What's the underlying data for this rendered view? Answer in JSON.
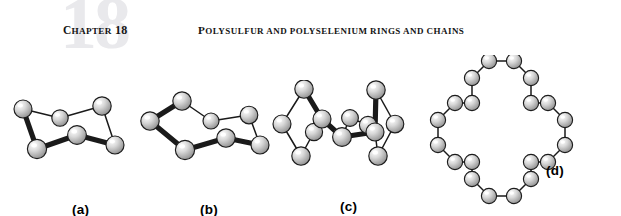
{
  "header": {
    "chapter_watermark": "18",
    "chapter_label_lead": "C",
    "chapter_label_rest": "HAPTER",
    "chapter_number": "18",
    "running_head_lead": "P",
    "running_head_rest": "OLYSULFUR AND POLYSELENIUM RINGS AND CHAINS",
    "watermark_color": "#e9e9ec",
    "text_color": "#141414"
  },
  "figure": {
    "caption_font_color": "#000000",
    "atom_fill_light": "#ffffff",
    "atom_fill_mid": "#d8d8d8",
    "atom_fill_dark": "#8e8e8e",
    "atom_stroke": "#1c1c1c",
    "bond_color": "#1a1a1a",
    "panels": [
      {
        "id": "panel-a",
        "label": "(a)",
        "molecule": "S6 hexasulfur chair ring",
        "atom_count": 6,
        "label_x": 60,
        "label_y": 119,
        "atoms": [
          {
            "x": 11,
            "y": 26,
            "r": 9.0
          },
          {
            "x": 48,
            "y": 35,
            "r": 8.2
          },
          {
            "x": 90,
            "y": 23,
            "r": 9.2
          },
          {
            "x": 103,
            "y": 62,
            "r": 9.0
          },
          {
            "x": 65,
            "y": 52,
            "r": 9.4
          },
          {
            "x": 25,
            "y": 66,
            "r": 9.6
          }
        ],
        "bonds": [
          {
            "from": 0,
            "to": 1,
            "weight": "thin"
          },
          {
            "from": 1,
            "to": 2,
            "weight": "thin"
          },
          {
            "from": 2,
            "to": 3,
            "weight": "thin"
          },
          {
            "from": 3,
            "to": 4,
            "weight": "thick"
          },
          {
            "from": 4,
            "to": 5,
            "weight": "thick"
          },
          {
            "from": 5,
            "to": 0,
            "weight": "thick"
          }
        ]
      },
      {
        "id": "panel-b",
        "label": "(b)",
        "molecule": "S7 heptasulfur ring",
        "atom_count": 7,
        "label_x": 62,
        "label_y": 119,
        "atoms": [
          {
            "x": 12,
            "y": 38,
            "r": 9.2
          },
          {
            "x": 44,
            "y": 18,
            "r": 9.2
          },
          {
            "x": 73,
            "y": 38,
            "r": 8.0
          },
          {
            "x": 111,
            "y": 32,
            "r": 8.8
          },
          {
            "x": 122,
            "y": 62,
            "r": 9.0
          },
          {
            "x": 88,
            "y": 55,
            "r": 9.2
          },
          {
            "x": 47,
            "y": 67,
            "r": 9.6
          }
        ],
        "bonds": [
          {
            "from": 0,
            "to": 1,
            "weight": "thick"
          },
          {
            "from": 1,
            "to": 2,
            "weight": "thin"
          },
          {
            "from": 2,
            "to": 3,
            "weight": "thin"
          },
          {
            "from": 3,
            "to": 4,
            "weight": "thin"
          },
          {
            "from": 4,
            "to": 5,
            "weight": "thick"
          },
          {
            "from": 5,
            "to": 6,
            "weight": "thick"
          },
          {
            "from": 6,
            "to": 0,
            "weight": "thick"
          }
        ]
      },
      {
        "id": "panel-c",
        "label": "(c)",
        "molecule": "S12 dodecasulfur ring, edge-on view",
        "atom_count": 12,
        "label_x": 68,
        "label_y": 119,
        "atoms": [
          {
            "x": 32,
            "y": 9,
            "r": 9.2
          },
          {
            "x": 10,
            "y": 44,
            "r": 9.0
          },
          {
            "x": 29,
            "y": 76,
            "r": 9.2
          },
          {
            "x": 42,
            "y": 52,
            "r": 8.6
          },
          {
            "x": 50,
            "y": 39,
            "r": 9.0
          },
          {
            "x": 70,
            "y": 57,
            "r": 9.4
          },
          {
            "x": 78,
            "y": 38,
            "r": 8.4
          },
          {
            "x": 96,
            "y": 45,
            "r": 8.6
          },
          {
            "x": 103,
            "y": 52,
            "r": 9.0
          },
          {
            "x": 104,
            "y": 10,
            "r": 9.2
          },
          {
            "x": 123,
            "y": 44,
            "r": 8.8
          },
          {
            "x": 106,
            "y": 76,
            "r": 9.2
          }
        ],
        "bonds": [
          {
            "from": 0,
            "to": 1,
            "weight": "thin"
          },
          {
            "from": 1,
            "to": 2,
            "weight": "thin"
          },
          {
            "from": 2,
            "to": 3,
            "weight": "thin"
          },
          {
            "from": 0,
            "to": 4,
            "weight": "thick"
          },
          {
            "from": 4,
            "to": 5,
            "weight": "thick"
          },
          {
            "from": 5,
            "to": 6,
            "weight": "thin"
          },
          {
            "from": 6,
            "to": 7,
            "weight": "thin"
          },
          {
            "from": 5,
            "to": 8,
            "weight": "thick"
          },
          {
            "from": 8,
            "to": 9,
            "weight": "thick"
          },
          {
            "from": 9,
            "to": 10,
            "weight": "thin"
          },
          {
            "from": 10,
            "to": 11,
            "weight": "thin"
          },
          {
            "from": 11,
            "to": 8,
            "weight": "thin"
          }
        ]
      },
      {
        "id": "panel-d",
        "label": "(d)",
        "molecule": "Large polysulfur cloverleaf macro-ring",
        "atom_count": 24,
        "label_x": 132,
        "label_y": 108,
        "atoms": [
          {
            "x": 75,
            "y": 6,
            "r": 7.6
          },
          {
            "x": 100,
            "y": 6,
            "r": 7.6
          },
          {
            "x": 117,
            "y": 23,
            "r": 7.6
          },
          {
            "x": 117,
            "y": 48,
            "r": 7.6
          },
          {
            "x": 134,
            "y": 48,
            "r": 7.6
          },
          {
            "x": 151,
            "y": 65,
            "r": 7.6
          },
          {
            "x": 151,
            "y": 90,
            "r": 7.6
          },
          {
            "x": 134,
            "y": 107,
            "r": 7.6
          },
          {
            "x": 117,
            "y": 107,
            "r": 7.6
          },
          {
            "x": 117,
            "y": 124,
            "r": 7.6
          },
          {
            "x": 100,
            "y": 141,
            "r": 7.6
          },
          {
            "x": 75,
            "y": 141,
            "r": 7.6
          },
          {
            "x": 58,
            "y": 124,
            "r": 7.6
          },
          {
            "x": 58,
            "y": 107,
            "r": 7.6
          },
          {
            "x": 41,
            "y": 107,
            "r": 7.6
          },
          {
            "x": 24,
            "y": 90,
            "r": 7.6
          },
          {
            "x": 24,
            "y": 65,
            "r": 7.6
          },
          {
            "x": 41,
            "y": 48,
            "r": 7.6
          },
          {
            "x": 58,
            "y": 48,
            "r": 7.6
          },
          {
            "x": 58,
            "y": 23,
            "r": 7.6
          },
          {
            "x": 86,
            "y": 14,
            "r": 0.0
          },
          {
            "x": 86,
            "y": 14,
            "r": 0.0
          },
          {
            "x": 86,
            "y": 14,
            "r": 0.0
          },
          {
            "x": 86,
            "y": 14,
            "r": 0.0
          }
        ],
        "bonds": [
          {
            "from": 0,
            "to": 1,
            "weight": "thin"
          },
          {
            "from": 1,
            "to": 2,
            "weight": "thin"
          },
          {
            "from": 2,
            "to": 3,
            "weight": "thin"
          },
          {
            "from": 3,
            "to": 4,
            "weight": "thin"
          },
          {
            "from": 4,
            "to": 5,
            "weight": "thin"
          },
          {
            "from": 5,
            "to": 6,
            "weight": "thin"
          },
          {
            "from": 6,
            "to": 7,
            "weight": "thin"
          },
          {
            "from": 7,
            "to": 8,
            "weight": "thin"
          },
          {
            "from": 8,
            "to": 9,
            "weight": "thin"
          },
          {
            "from": 9,
            "to": 10,
            "weight": "thin"
          },
          {
            "from": 10,
            "to": 11,
            "weight": "thin"
          },
          {
            "from": 11,
            "to": 12,
            "weight": "thin"
          },
          {
            "from": 12,
            "to": 13,
            "weight": "thin"
          },
          {
            "from": 13,
            "to": 14,
            "weight": "thin"
          },
          {
            "from": 14,
            "to": 15,
            "weight": "thin"
          },
          {
            "from": 15,
            "to": 16,
            "weight": "thin"
          },
          {
            "from": 16,
            "to": 17,
            "weight": "thin"
          },
          {
            "from": 17,
            "to": 18,
            "weight": "thin"
          },
          {
            "from": 18,
            "to": 19,
            "weight": "thin"
          },
          {
            "from": 19,
            "to": 0,
            "weight": "thin"
          }
        ]
      }
    ],
    "panel_positions": [
      {
        "left": 12,
        "top": 28,
        "width": 125,
        "height": 90
      },
      {
        "left": 138,
        "top": 28,
        "width": 140,
        "height": 90
      },
      {
        "left": 272,
        "top": 25,
        "width": 140,
        "height": 95
      },
      {
        "left": 414,
        "top": 0,
        "width": 190,
        "height": 160
      }
    ]
  }
}
